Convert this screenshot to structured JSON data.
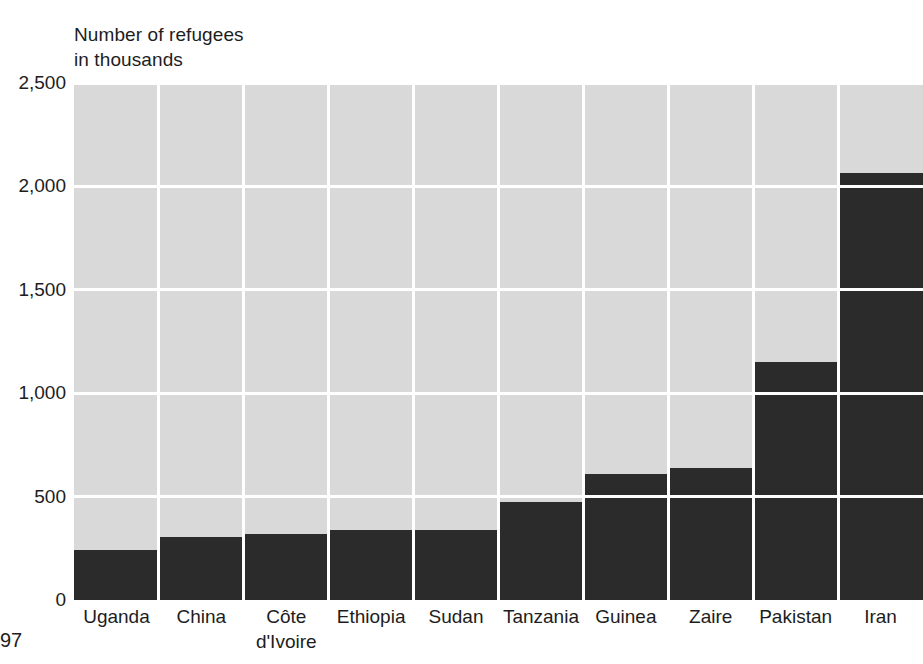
{
  "axis_title": "Number of refugees\nin thousands",
  "folio": "97",
  "colors": {
    "bar": "#2b2b2b",
    "plot_background": "#d9d9d9",
    "gridline": "#ffffff",
    "text": "#1d1d1d",
    "page_background": "#ffffff"
  },
  "chart_data": {
    "type": "bar",
    "title": "Number of refugees in thousands",
    "xlabel": "",
    "ylabel": "Number of refugees in thousands",
    "categories": [
      "Uganda",
      "China",
      "Côte\nd'Ivoire",
      "Ethiopia",
      "Sudan",
      "Tanzania",
      "Guinea",
      "Zaire",
      "Pakistan",
      "Iran"
    ],
    "values": [
      240,
      305,
      320,
      338,
      338,
      475,
      610,
      638,
      1150,
      2065
    ],
    "ylim": [
      0,
      2500
    ],
    "yticks": [
      0,
      500,
      1000,
      1500,
      2000,
      2500
    ],
    "ytick_labels": [
      "0",
      "500",
      "1,000",
      "1,500",
      "2,000",
      "2,500"
    ],
    "grid": true,
    "legend": "none",
    "units": "thousands of refugees"
  }
}
